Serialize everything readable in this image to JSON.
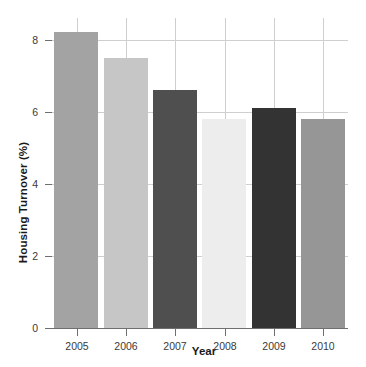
{
  "chart_data": {
    "type": "bar",
    "title": "",
    "xlabel": "Year",
    "ylabel": "Housing Turnover (%)",
    "categories": [
      "2005",
      "2006",
      "2007",
      "2008",
      "2009",
      "2010"
    ],
    "values": [
      8.2,
      7.5,
      6.6,
      5.8,
      6.1,
      5.8
    ],
    "bar_colors": [
      "#a3a3a3",
      "#c6c6c6",
      "#4f4f4f",
      "#ededed",
      "#333333",
      "#969696"
    ],
    "ylim": [
      0,
      8.6
    ],
    "yticks": [
      0,
      2,
      4,
      6,
      8
    ],
    "ytick_labels": [
      "0",
      "2",
      "4",
      "6",
      "8"
    ],
    "xtick_labels": [
      "2005",
      "2006",
      "2007",
      "2008",
      "2009",
      "2010"
    ],
    "grid": {
      "horizontal": true,
      "vertical": true,
      "color": "#cfcfcf"
    },
    "legend": null,
    "background": "#ffffff",
    "axis_color": "#6f6f6f"
  }
}
